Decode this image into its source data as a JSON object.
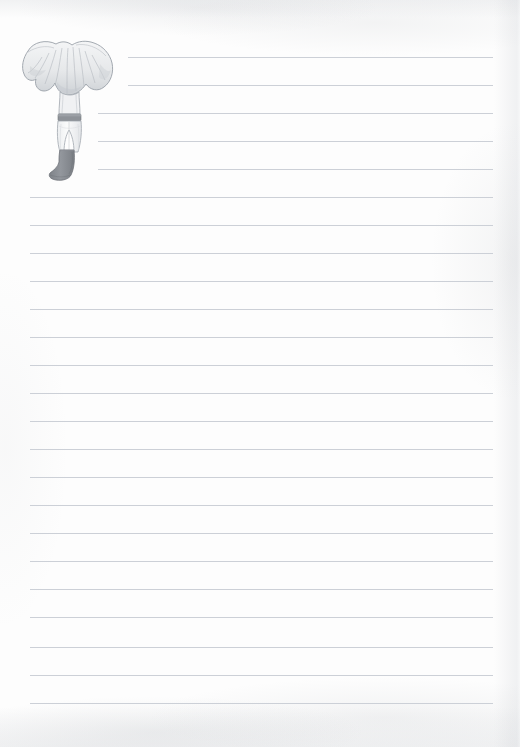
{
  "page": {
    "kind": "scanned-ruled-notepaper",
    "width": 520,
    "height": 747,
    "paper_color": "#fdfdfd",
    "rule_color": "#c9ced5",
    "rule_spacing_px": 28,
    "rule_left_default": 30,
    "rule_right": 493
  },
  "illustration": {
    "name": "mushroom-figure",
    "description": "Pencil illustration of a chanterelle-style mushroom whose stem is drawn as a pair of legs in light breeches with a dark belt and tall dark boots",
    "cap_color": "#e9eaec",
    "cap_outline_color": "#9aa0a8",
    "gill_color": "#c6cace",
    "breeches_color": "#f3f4f5",
    "belt_color": "#8e9298",
    "boot_color": "#8c9096",
    "bounds": {
      "x": 16,
      "y": 36,
      "width": 104,
      "height": 148
    }
  },
  "rules": [
    {
      "index": 1,
      "y": 57,
      "x1": 128,
      "x2": 493
    },
    {
      "index": 2,
      "y": 85,
      "x1": 128,
      "x2": 493
    },
    {
      "index": 3,
      "y": 113,
      "x1": 98,
      "x2": 493
    },
    {
      "index": 4,
      "y": 141,
      "x1": 98,
      "x2": 493
    },
    {
      "index": 5,
      "y": 169,
      "x1": 98,
      "x2": 493
    },
    {
      "index": 6,
      "y": 197,
      "x1": 30,
      "x2": 493
    },
    {
      "index": 7,
      "y": 225,
      "x1": 30,
      "x2": 493
    },
    {
      "index": 8,
      "y": 253,
      "x1": 30,
      "x2": 493
    },
    {
      "index": 9,
      "y": 281,
      "x1": 30,
      "x2": 493
    },
    {
      "index": 10,
      "y": 309,
      "x1": 30,
      "x2": 493
    },
    {
      "index": 11,
      "y": 337,
      "x1": 30,
      "x2": 493
    },
    {
      "index": 12,
      "y": 365,
      "x1": 30,
      "x2": 493
    },
    {
      "index": 13,
      "y": 393,
      "x1": 30,
      "x2": 493
    },
    {
      "index": 14,
      "y": 421,
      "x1": 30,
      "x2": 493
    },
    {
      "index": 15,
      "y": 449,
      "x1": 30,
      "x2": 493
    },
    {
      "index": 16,
      "y": 477,
      "x1": 30,
      "x2": 493
    },
    {
      "index": 17,
      "y": 505,
      "x1": 30,
      "x2": 493
    },
    {
      "index": 18,
      "y": 533,
      "x1": 30,
      "x2": 493
    },
    {
      "index": 19,
      "y": 561,
      "x1": 30,
      "x2": 493
    },
    {
      "index": 20,
      "y": 589,
      "x1": 30,
      "x2": 493
    },
    {
      "index": 21,
      "y": 617,
      "x1": 30,
      "x2": 493
    },
    {
      "index": 22,
      "y": 647,
      "x1": 30,
      "x2": 493
    },
    {
      "index": 23,
      "y": 675,
      "x1": 30,
      "x2": 493
    },
    {
      "index": 24,
      "y": 703,
      "x1": 30,
      "x2": 493
    }
  ]
}
